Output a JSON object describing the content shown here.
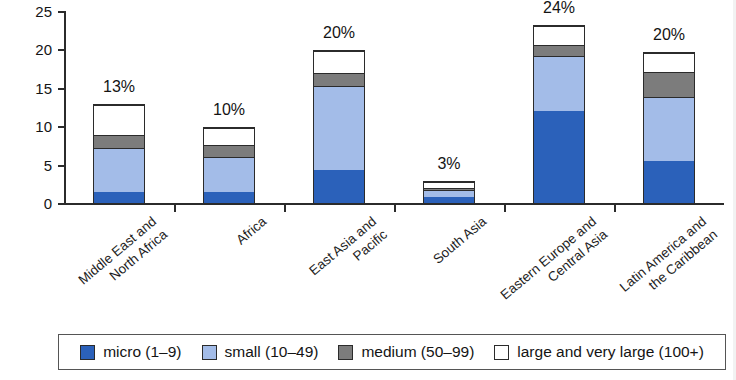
{
  "chart_data": {
    "type": "bar",
    "subtype": "stacked-bar",
    "title": "",
    "xlabel": "",
    "ylabel": "percent",
    "ylim": [
      0,
      25
    ],
    "yticks": [
      0,
      5,
      10,
      15,
      20,
      25
    ],
    "grid": false,
    "legend_position": "bottom",
    "categories": [
      "Middle East and\nNorth Africa",
      "Africa",
      "East Asia and\nPacific",
      "South Asia",
      "Eastern Europe and\nCentral Asia",
      "Latin America and\nthe Caribbean"
    ],
    "series": [
      {
        "name": "micro (1–9)",
        "color": "#2b61ba",
        "values": [
          1.5,
          1.5,
          4.3,
          0.8,
          12.1,
          5.5
        ]
      },
      {
        "name": "small (10–49)",
        "color": "#a3bce8",
        "values": [
          5.8,
          4.7,
          11.2,
          1.0,
          7.2,
          8.5
        ]
      },
      {
        "name": "medium (50–99)",
        "color": "#7c7c7c",
        "values": [
          1.7,
          1.6,
          1.7,
          0.4,
          1.5,
          3.3
        ]
      },
      {
        "name": "large and very large (100+)",
        "color": "#ffffff",
        "values": [
          4.0,
          2.2,
          2.8,
          0.8,
          2.5,
          2.5
        ]
      }
    ],
    "totals": [
      13.0,
      10.0,
      20.0,
      3.0,
      23.3,
      19.8
    ],
    "data_labels": [
      "13%",
      "10%",
      "20%",
      "3%",
      "24%",
      "20%"
    ]
  },
  "axis": {
    "y_title": "percent",
    "y_tick_labels": [
      "25",
      "20",
      "15",
      "10",
      "5",
      "0"
    ]
  },
  "legend": {
    "items": [
      {
        "label": "micro (1–9)",
        "key": "micro"
      },
      {
        "label": "small (10–49)",
        "key": "small"
      },
      {
        "label": "medium (50–99)",
        "key": "medium"
      },
      {
        "label": "large and very large (100+)",
        "key": "large"
      }
    ]
  }
}
